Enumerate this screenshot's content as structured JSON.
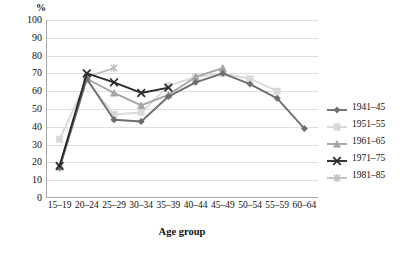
{
  "chart_data": {
    "type": "line",
    "title": "",
    "xlabel": "Age group",
    "ylabel": "%",
    "unit_label": "%",
    "ylim": [
      0,
      100
    ],
    "ytick_step": 10,
    "yticks": [
      0,
      10,
      20,
      30,
      40,
      50,
      60,
      70,
      80,
      90,
      100
    ],
    "ytick_labels": [
      "0",
      "10",
      "20",
      "30",
      "40",
      "50",
      "60",
      "70",
      "80",
      "90",
      "100"
    ],
    "grid": true,
    "grid_axis": "y",
    "legend_position": "right",
    "categories": [
      "15–19",
      "20–24",
      "25–29",
      "30–34",
      "35–39",
      "40–44",
      "45–49",
      "50–54",
      "55–59",
      "60–64"
    ],
    "series": [
      {
        "name": "1941–45",
        "marker": "diamond",
        "color": "#6e6e6e",
        "values": [
          17,
          67,
          44,
          43,
          57,
          65,
          70,
          64,
          56,
          39
        ]
      },
      {
        "name": "1951–55",
        "marker": "square",
        "color": "#d9d9d9",
        "values": [
          33,
          66,
          47,
          48,
          63,
          68,
          70,
          67,
          60,
          null
        ]
      },
      {
        "name": "1961–65",
        "marker": "triangle",
        "color": "#a5a5a5",
        "values": [
          18,
          67,
          59,
          52,
          58,
          68,
          73,
          null,
          null,
          null
        ]
      },
      {
        "name": "1971–75",
        "marker": "x",
        "color": "#2b2b2b",
        "values": [
          18,
          70,
          65,
          59,
          62,
          null,
          null,
          null,
          null,
          null
        ]
      },
      {
        "name": "1981–85",
        "marker": "asterisk",
        "color": "#bfbfbf",
        "values": [
          17,
          68,
          73,
          null,
          null,
          null,
          null,
          null,
          null,
          null
        ]
      }
    ]
  },
  "legend": {
    "items": [
      {
        "label": "1941–45"
      },
      {
        "label": "1951–55"
      },
      {
        "label": "1961–65"
      },
      {
        "label": "1971–75"
      },
      {
        "label": "1981–85"
      }
    ]
  }
}
